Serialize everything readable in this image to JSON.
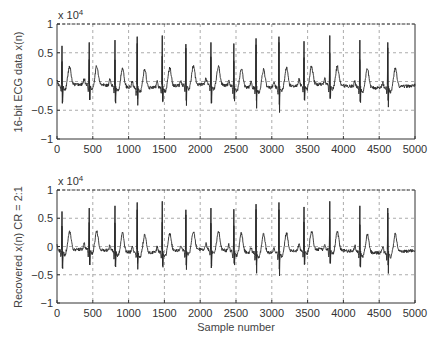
{
  "chart_data": [
    {
      "type": "line",
      "title": "",
      "ylabel": "16-bit ECG data x(n)",
      "xlabel": "",
      "y_multiplier": "x 10^4",
      "xlim": [
        0,
        5000
      ],
      "ylim": [
        -1,
        1
      ],
      "xticks": [
        0,
        500,
        1000,
        1500,
        2000,
        2500,
        3000,
        3500,
        4000,
        4500,
        5000
      ],
      "yticks": [
        1,
        0.5,
        0,
        -0.5,
        -1
      ],
      "ytick_labels": [
        "1",
        "0.5",
        "0",
        "−0.5",
        "−1"
      ],
      "grid": true,
      "r_peaks": [
        {
          "x": 70,
          "peak": 0.62,
          "trough": -0.38
        },
        {
          "x": 450,
          "peak": 0.68,
          "trough": -0.32
        },
        {
          "x": 810,
          "peak": 0.72,
          "trough": -0.35
        },
        {
          "x": 1120,
          "peak": 0.78,
          "trough": -0.3
        },
        {
          "x": 1470,
          "peak": 0.8,
          "trough": -0.34
        },
        {
          "x": 1800,
          "peak": 0.65,
          "trough": -0.33
        },
        {
          "x": 2150,
          "peak": 0.68,
          "trough": -0.38
        },
        {
          "x": 2470,
          "peak": 0.66,
          "trough": -0.3
        },
        {
          "x": 2780,
          "peak": 0.75,
          "trough": -0.33
        },
        {
          "x": 3100,
          "peak": 0.78,
          "trough": -0.4
        },
        {
          "x": 3450,
          "peak": 0.7,
          "trough": -0.32
        },
        {
          "x": 3810,
          "peak": 0.8,
          "trough": -0.3
        },
        {
          "x": 4230,
          "peak": 0.72,
          "trough": -0.35
        },
        {
          "x": 4620,
          "peak": 0.68,
          "trough": -0.33
        }
      ]
    },
    {
      "type": "line",
      "title": "",
      "ylabel": "Recovered x(n) CR = 2:1",
      "xlabel": "Sample number",
      "y_multiplier": "x 10^4",
      "xlim": [
        0,
        5000
      ],
      "ylim": [
        -1,
        1
      ],
      "xticks": [
        0,
        500,
        1000,
        1500,
        2000,
        2500,
        3000,
        3500,
        4000,
        4500,
        5000
      ],
      "yticks": [
        1,
        0.5,
        0,
        -0.5,
        -1
      ],
      "ytick_labels": [
        "1",
        "0.5",
        "0",
        "−0.5",
        "−1"
      ],
      "grid": true,
      "r_peaks": [
        {
          "x": 70,
          "peak": 0.62,
          "trough": -0.38
        },
        {
          "x": 450,
          "peak": 0.68,
          "trough": -0.32
        },
        {
          "x": 810,
          "peak": 0.72,
          "trough": -0.35
        },
        {
          "x": 1120,
          "peak": 0.78,
          "trough": -0.3
        },
        {
          "x": 1470,
          "peak": 0.8,
          "trough": -0.34
        },
        {
          "x": 1800,
          "peak": 0.65,
          "trough": -0.33
        },
        {
          "x": 2150,
          "peak": 0.68,
          "trough": -0.38
        },
        {
          "x": 2470,
          "peak": 0.66,
          "trough": -0.3
        },
        {
          "x": 2780,
          "peak": 0.75,
          "trough": -0.33
        },
        {
          "x": 3100,
          "peak": 0.78,
          "trough": -0.4
        },
        {
          "x": 3450,
          "peak": 0.7,
          "trough": -0.32
        },
        {
          "x": 3810,
          "peak": 0.8,
          "trough": -0.3
        },
        {
          "x": 4230,
          "peak": 0.72,
          "trough": -0.35
        },
        {
          "x": 4620,
          "peak": 0.68,
          "trough": -0.33
        }
      ]
    }
  ],
  "plots": [
    {
      "ylabel": "16-bit ECG data x(n)",
      "multiplier_base": "x 10",
      "multiplier_exp": "4"
    },
    {
      "ylabel": "Recovered x(n) CR = 2:1",
      "multiplier_base": "x 10",
      "multiplier_exp": "4",
      "xlabel": "Sample number"
    }
  ],
  "style": {
    "line_color": "#2a2a2a",
    "grid_color": "#888888",
    "axis_color": "#333333"
  }
}
